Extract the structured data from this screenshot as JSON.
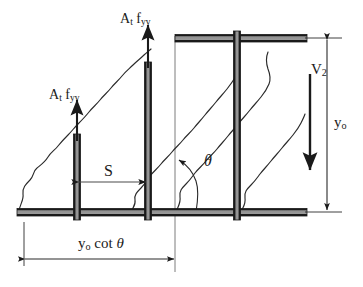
{
  "figure": {
    "type": "engineering-diagram",
    "width": 363,
    "height": 287,
    "background_color": "#ffffff",
    "line_color": "#1a1a1a",
    "chord_fill_color": "#8c8c8c"
  },
  "labels": {
    "stirrup_force_left": {
      "text": "A",
      "sub1": "t",
      "text2": " f",
      "sub2": "yv",
      "meaning": "stirrup-yield-force"
    },
    "stirrup_force_mid": {
      "text": "A",
      "sub1": "t",
      "text2": " f",
      "sub2": "yv",
      "meaning": "stirrup-yield-force"
    },
    "spacing": {
      "text": "S",
      "meaning": "stirrup-spacing"
    },
    "crack_angle": {
      "text": "θ",
      "meaning": "crack-inclination-angle"
    },
    "shear_force": {
      "text": "V",
      "sub1": "2",
      "meaning": "shear-force-V2"
    },
    "depth": {
      "text": "y",
      "sub1": "o",
      "meaning": "effective-depth"
    },
    "horizontal_projection": {
      "text": "y",
      "sub1": "o",
      "text2": " cot ",
      "theta": "θ",
      "meaning": "horizontal-crack-projection"
    }
  },
  "geometry": {
    "top_chord": {
      "x1": 175,
      "x2": 307,
      "y": 38,
      "thickness": 8
    },
    "bottom_chord": {
      "x1": 17,
      "x2": 307,
      "y": 212,
      "thickness": 8
    },
    "stirrups": [
      {
        "name": "stirrup-1",
        "x": 77,
        "y_top": 134,
        "y_bottom": 220
      },
      {
        "name": "stirrup-2",
        "x": 148,
        "y_top": 62,
        "y_bottom": 220
      },
      {
        "name": "stirrup-3",
        "x": 237,
        "y_top": 31,
        "y_bottom": 220
      }
    ],
    "force_arrows": [
      {
        "name": "force-arrow-left",
        "x": 77,
        "y_tail": 134,
        "y_head": 98
      },
      {
        "name": "force-arrow-mid",
        "x": 148,
        "y_tail": 62,
        "y_head": 22
      }
    ],
    "shear_arrow": {
      "x": 310,
      "y_tail": 73,
      "y_head": 168
    },
    "dimension_yo": {
      "x": 327,
      "y1": 38,
      "y2": 212
    },
    "dimension_cot": {
      "y": 258,
      "x1": 24,
      "x2": 175
    },
    "dimension_s": {
      "y": 182,
      "x1": 79,
      "x2": 147
    },
    "reference_line": {
      "x": 175,
      "y1": 38,
      "y2": 270
    }
  },
  "crack_paths": [
    {
      "name": "crack-1",
      "start": [
        19,
        211
      ],
      "end": [
        150,
        50
      ]
    },
    {
      "name": "crack-2",
      "start": [
        130,
        212
      ],
      "end": [
        237,
        33
      ]
    },
    {
      "name": "crack-3",
      "start": [
        175,
        212
      ],
      "end": [
        268,
        52
      ]
    },
    {
      "name": "crack-4",
      "start": [
        240,
        212
      ],
      "end": [
        305,
        118
      ]
    }
  ]
}
